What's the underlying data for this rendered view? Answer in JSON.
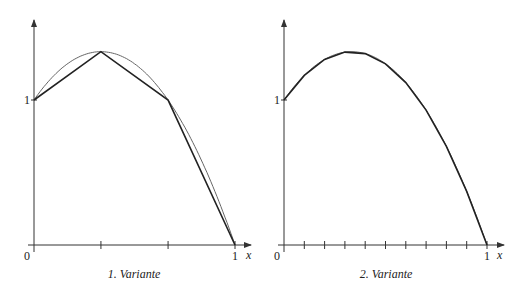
{
  "chart_data": [
    {
      "type": "line",
      "title": "1. Variante",
      "function": "f(x) = 1 + 2x - 3x^2",
      "xlabel": "x",
      "ylabel": "",
      "xlim": [
        0,
        1
      ],
      "ylim": [
        0,
        1.5
      ],
      "x_tick_labels": [
        "0",
        "1"
      ],
      "y_tick_labels": [
        "1"
      ],
      "x_ticks": [
        0,
        0.333,
        0.667,
        1
      ],
      "series": [
        {
          "name": "curve",
          "x": [
            0,
            0.1,
            0.2,
            0.333,
            0.5,
            0.667,
            0.8,
            0.9,
            1
          ],
          "values": [
            1,
            1.17,
            1.28,
            1.333,
            1.25,
            1,
            0.68,
            0.37,
            0
          ]
        },
        {
          "name": "polygon",
          "x": [
            0,
            0.333,
            0.667,
            1
          ],
          "values": [
            1,
            1.333,
            1,
            0
          ]
        }
      ],
      "grid": false
    },
    {
      "type": "line",
      "title": "2. Variante",
      "function": "f(x) = 1 + 2x - 3x^2",
      "xlabel": "x",
      "ylabel": "",
      "xlim": [
        0,
        1
      ],
      "ylim": [
        0,
        1.5
      ],
      "x_tick_labels": [
        "0",
        "1"
      ],
      "y_tick_labels": [
        "1"
      ],
      "x_ticks": [
        0,
        0.1,
        0.2,
        0.3,
        0.4,
        0.5,
        0.6,
        0.7,
        0.8,
        0.9,
        1
      ],
      "series": [
        {
          "name": "curve",
          "x": [
            0,
            0.1,
            0.2,
            0.3,
            0.4,
            0.5,
            0.6,
            0.7,
            0.8,
            0.9,
            1
          ],
          "values": [
            1,
            1.17,
            1.28,
            1.33,
            1.32,
            1.25,
            1.12,
            0.93,
            0.68,
            0.37,
            0
          ]
        },
        {
          "name": "polygon",
          "x": [
            0,
            0.1,
            0.2,
            0.3,
            0.4,
            0.5,
            0.6,
            0.7,
            0.8,
            0.9,
            1
          ],
          "values": [
            1,
            1.17,
            1.28,
            1.33,
            1.32,
            1.25,
            1.12,
            0.93,
            0.68,
            0.37,
            0
          ]
        }
      ],
      "grid": false
    }
  ],
  "labels": {
    "left": {
      "origin": "0",
      "x_one": "1",
      "y_one": "1",
      "x_axis": "x",
      "caption": "1. Variante"
    },
    "right": {
      "origin": "0",
      "x_one": "1",
      "y_one": "1",
      "x_axis": "x",
      "caption": "2. Variante"
    }
  },
  "colors": {
    "axis": "#333333",
    "curve": "#666666",
    "polygon": "#222222"
  }
}
